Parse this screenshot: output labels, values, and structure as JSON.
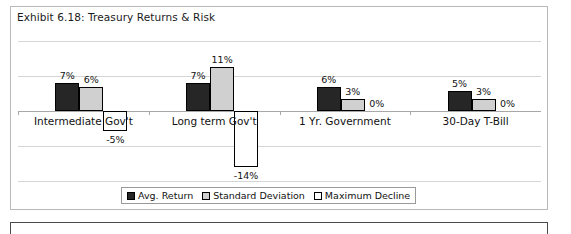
{
  "exhibit": {
    "title": "Exhibit 6.18: Treasury Returns & Risk"
  },
  "colors": {
    "avg_return": "#262626",
    "standard_deviation": "#d0d0d0",
    "maximum_decline": "#ffffff",
    "bar_outline": "#000000",
    "gridline": "#d5d5d5",
    "axis": "#a8a8a8",
    "frame": "#b9b9b9",
    "text": "#111111"
  },
  "chart_data": {
    "type": "bar",
    "title": "Exhibit 6.18: Treasury Returns & Risk",
    "xlabel": "",
    "ylabel": "",
    "ylim": [
      -17.6,
      17.6
    ],
    "grid": true,
    "gridlines": [
      -17.6,
      -8.8,
      0,
      8.8,
      17.6
    ],
    "legend_position": "bottom",
    "categories": [
      "Intermediate Gov't",
      "Long term Gov't",
      "1 Yr. Government",
      "30-Day T-Bill"
    ],
    "series": [
      {
        "name": "Avg. Return",
        "values": [
          7,
          7,
          6,
          5
        ],
        "labels": [
          "7%",
          "7%",
          "6%",
          "5%"
        ],
        "color": "#262626"
      },
      {
        "name": "Standard Deviation",
        "values": [
          6,
          11,
          3,
          3
        ],
        "labels": [
          "6%",
          "11%",
          "3%",
          "3%"
        ],
        "color": "#d0d0d0"
      },
      {
        "name": "Maximum Decline",
        "values": [
          -5,
          -14,
          0,
          0
        ],
        "labels": [
          "-5%",
          "-14%",
          "0%",
          "0%"
        ],
        "color": "#ffffff"
      }
    ]
  },
  "legend": {
    "entries": [
      {
        "label": "Avg. Return"
      },
      {
        "label": "Standard Deviation"
      },
      {
        "label": "Maximum Decline"
      }
    ]
  }
}
